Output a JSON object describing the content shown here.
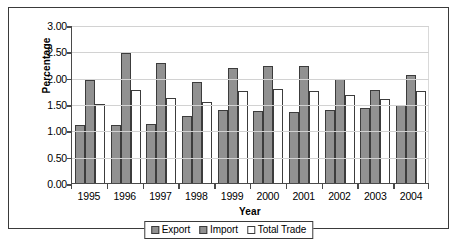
{
  "chart_data": {
    "type": "bar",
    "title": "",
    "xlabel": "Year",
    "ylabel": "Percentage",
    "categories": [
      "1995",
      "1996",
      "1997",
      "1998",
      "1999",
      "2000",
      "2001",
      "2002",
      "2003",
      "2004"
    ],
    "series": [
      {
        "name": "Export",
        "color": "#919191",
        "values": [
          1.1,
          1.11,
          1.12,
          1.27,
          1.38,
          1.37,
          1.34,
          1.39,
          1.43,
          1.48
        ]
      },
      {
        "name": "Import",
        "color": "#919191",
        "values": [
          1.95,
          2.47,
          2.27,
          1.91,
          2.18,
          2.22,
          2.22,
          1.98,
          1.77,
          2.05
        ]
      },
      {
        "name": "Total Trade",
        "color": "#ffffff",
        "values": [
          1.5,
          1.76,
          1.62,
          1.54,
          1.75,
          1.78,
          1.75,
          1.67,
          1.59,
          1.75
        ]
      }
    ],
    "ylim": [
      0.0,
      3.0
    ],
    "ytick_values": [
      0.0,
      0.5,
      1.0,
      1.5,
      2.0,
      2.5,
      3.0
    ],
    "ytick_labels": [
      "0.00",
      "0.50",
      "1.00",
      "1.50",
      "2.00",
      "2.50",
      "3.00"
    ],
    "grid": "horizontal",
    "legend_position": "bottom"
  },
  "legend": {
    "items": [
      {
        "label": "Export",
        "swatch": "export-swatch-icon"
      },
      {
        "label": "Import",
        "swatch": "import-swatch-icon"
      },
      {
        "label": "Total Trade",
        "swatch": "total-trade-swatch-icon"
      }
    ]
  },
  "caption": ""
}
